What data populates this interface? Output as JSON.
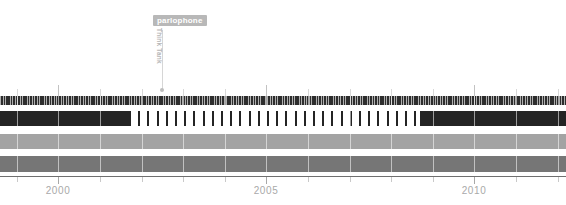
{
  "chart_data": {
    "type": "bar",
    "title": "",
    "subtitle": "",
    "xlabel": "",
    "ylabel": "",
    "orientation": "horizontal-timeline",
    "grid": true,
    "legend_position": "none",
    "xlim": [
      1998.6,
      2012.2
    ],
    "x_tick_labels": [
      "2000",
      "2005",
      "2010"
    ],
    "x_tick_values": [
      2000,
      2005,
      2010
    ],
    "x_minor_tick_values": [
      1999,
      2001,
      2002,
      2003,
      2004,
      2006,
      2007,
      2008,
      2009,
      2011,
      2012
    ],
    "series": [
      {
        "name": "hatched-track",
        "style": "hatched",
        "color": "#2d2d2d",
        "segments": [
          {
            "start": 1998.6,
            "end": 2012.2,
            "fill": "hatched"
          }
        ]
      },
      {
        "name": "contract-track",
        "style": "solid-dashed-solid",
        "color": "#242424",
        "segments": [
          {
            "start": 1998.6,
            "end": 2001.7,
            "fill": "solid"
          },
          {
            "start": 2001.7,
            "end": 2008.7,
            "fill": "dashed"
          },
          {
            "start": 2008.7,
            "end": 2012.2,
            "fill": "solid"
          }
        ]
      },
      {
        "name": "light-gray-track",
        "style": "solid",
        "color": "#a3a3a3",
        "segments": [
          {
            "start": 1998.6,
            "end": 2012.2,
            "fill": "solid"
          }
        ]
      },
      {
        "name": "mid-gray-track",
        "style": "solid",
        "color": "#767676",
        "segments": [
          {
            "start": 1998.6,
            "end": 2012.2,
            "fill": "solid"
          }
        ]
      }
    ],
    "annotations": [
      {
        "badge_label": "parlophone",
        "vertical_label": "Think Tank",
        "x_value": 2002.5,
        "badge_color": "#b8b8b8",
        "badge_text_color": "#ffffff",
        "leader_color": "#d6d6d6",
        "marker_color": "#bdbdbd",
        "vertical_label_color": "#b5b5b5"
      }
    ]
  },
  "axis": {
    "labels": [
      {
        "text": "2000",
        "x_px": 38
      },
      {
        "text": "2005",
        "x_px": 245
      },
      {
        "text": "2010",
        "x_px": 451
      }
    ],
    "line_color": "#6f6f6f",
    "tick_color": "#c9c9c9",
    "label_color": "#a9a9a9"
  },
  "annotation": {
    "badge": "parlophone",
    "vertical": "Think Tank"
  }
}
